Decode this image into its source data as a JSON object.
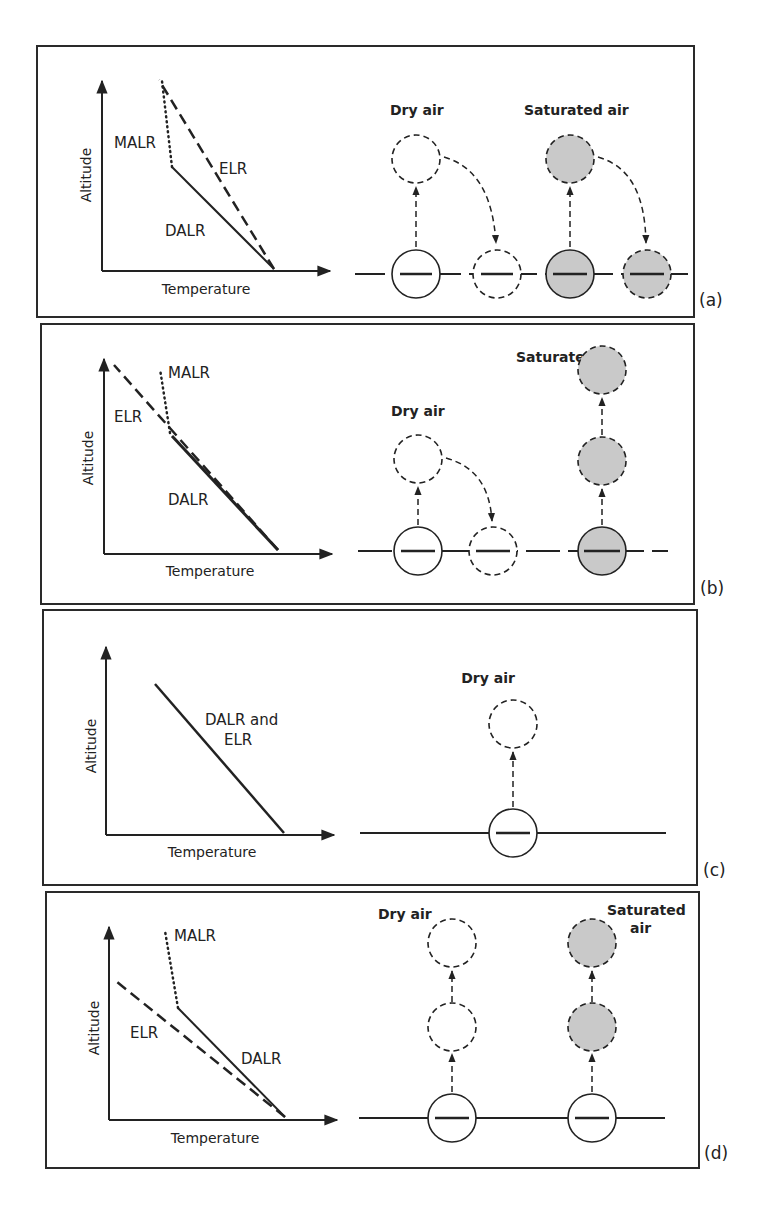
{
  "figure": {
    "colors": {
      "ink": "#222222",
      "saturated_fill": "#c9c9c9",
      "background": "#ffffff"
    },
    "axes": {
      "x_label": "Temperature",
      "y_label": "Altitude"
    },
    "panels": [
      {
        "id": "a",
        "label": "(a)",
        "lines": {
          "malr": "MALR",
          "elr": "ELR",
          "dalr": "DALR"
        },
        "parcels": {
          "dry_label": "Dry air",
          "saturated_label": "Saturated air"
        }
      },
      {
        "id": "b",
        "label": "(b)",
        "lines": {
          "malr": "MALR",
          "elr": "ELR",
          "dalr": "DALR"
        },
        "parcels": {
          "dry_label": "Dry air",
          "saturated_label": "Saturated air"
        }
      },
      {
        "id": "c",
        "label": "(c)",
        "lines": {
          "combined_1": "DALR and",
          "combined_2": "ELR"
        },
        "parcels": {
          "dry_label": "Dry air"
        }
      },
      {
        "id": "d",
        "label": "(d)",
        "lines": {
          "malr": "MALR",
          "elr": "ELR",
          "dalr": "DALR"
        },
        "parcels": {
          "dry_label": "Dry air",
          "saturated_label_1": "Saturated",
          "saturated_label_2": "air"
        }
      }
    ]
  }
}
